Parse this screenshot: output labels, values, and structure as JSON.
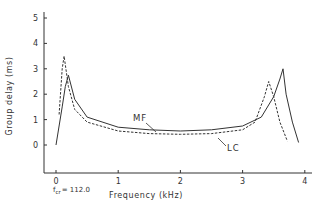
{
  "chart_data": {
    "type": "line",
    "title": "",
    "xlabel": "Frequency (kHz)",
    "ylabel": "Group delay (ms)",
    "xlim": [
      0,
      4
    ],
    "ylim": [
      0,
      5
    ],
    "xticks": [
      "0",
      "1",
      "2",
      "3",
      "4"
    ],
    "yticks": [
      "0",
      "1",
      "2",
      "3",
      "4",
      "5"
    ],
    "grid": false,
    "legend": "inline annotations",
    "annotations": {
      "fcr_label": "f",
      "fcr_sub": "cr",
      "fcr_value": "= 112.0",
      "mf_label": "MF",
      "lc_label": "LC"
    },
    "series": [
      {
        "name": "MF",
        "style": "solid",
        "x": [
          0.0,
          0.1,
          0.15,
          0.2,
          0.3,
          0.5,
          1.0,
          1.5,
          2.0,
          2.5,
          3.0,
          3.3,
          3.5,
          3.6,
          3.65,
          3.7,
          3.8,
          3.9
        ],
        "values": [
          0.0,
          1.5,
          2.3,
          2.75,
          1.8,
          1.1,
          0.7,
          0.6,
          0.55,
          0.6,
          0.75,
          1.1,
          1.9,
          2.6,
          3.0,
          2.0,
          0.9,
          0.1
        ]
      },
      {
        "name": "LC",
        "style": "dashed",
        "x": [
          0.05,
          0.1,
          0.13,
          0.2,
          0.3,
          0.5,
          1.0,
          1.5,
          2.0,
          2.5,
          3.0,
          3.2,
          3.35,
          3.42,
          3.5,
          3.6,
          3.72
        ],
        "values": [
          1.2,
          3.0,
          3.5,
          2.3,
          1.4,
          0.9,
          0.55,
          0.45,
          0.42,
          0.45,
          0.6,
          0.9,
          1.9,
          2.5,
          1.9,
          0.9,
          0.15
        ]
      }
    ]
  }
}
